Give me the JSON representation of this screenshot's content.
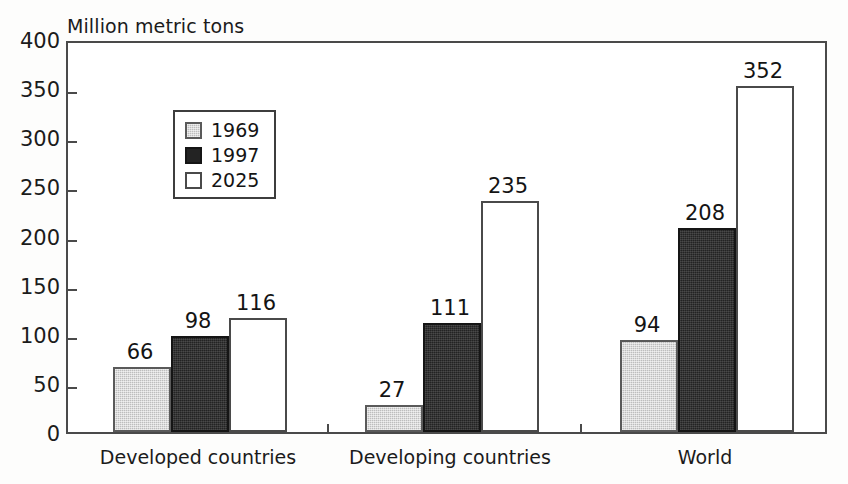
{
  "chart_data": {
    "type": "bar",
    "title": "",
    "ylabel": "Million metric tons",
    "xlabel": "",
    "ylim": [
      0,
      400
    ],
    "ytick_step": 50,
    "yticks": [
      0,
      50,
      100,
      150,
      200,
      250,
      300,
      350,
      400
    ],
    "grid": false,
    "legend_position": "upper-left-inside",
    "categories": [
      "Developed countries",
      "Developing countries",
      "World"
    ],
    "series": [
      {
        "name": "1969",
        "color": "#bdbdbd",
        "values": [
          66,
          27,
          94
        ]
      },
      {
        "name": "1997",
        "color": "#232323",
        "values": [
          98,
          111,
          208
        ]
      },
      {
        "name": "2025",
        "color": "#ffffff",
        "values": [
          116,
          235,
          352
        ]
      }
    ],
    "data_labels": [
      [
        "66",
        "98",
        "116"
      ],
      [
        "27",
        "111",
        "235"
      ],
      [
        "94",
        "208",
        "352"
      ]
    ]
  },
  "axis": {
    "y_title": "Million metric tons",
    "tick_labels": [
      "400",
      "350",
      "300",
      "250",
      "200",
      "150",
      "100",
      "50",
      "0"
    ]
  },
  "legend": {
    "entries": [
      {
        "label": "1969"
      },
      {
        "label": "1997"
      },
      {
        "label": "2025"
      }
    ]
  }
}
